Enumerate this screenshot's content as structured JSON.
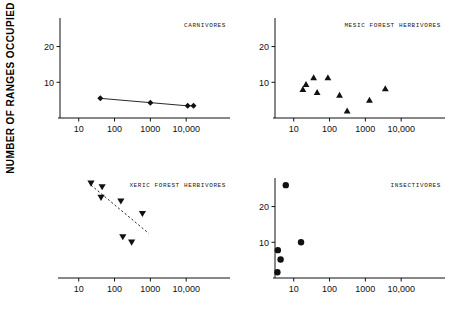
{
  "figure": {
    "y_axis_title": "NUMBER OF RANGES OCCUPIED",
    "x_tick_labels": [
      "10",
      "100",
      "1000",
      "10,000"
    ],
    "y_tick_labels": [
      "10",
      "20"
    ],
    "accent_color": "#111111"
  },
  "chart_data": [
    {
      "type": "scatter",
      "title": "CARNIVORES",
      "panel": "top-left",
      "marker": "diamond",
      "xlabel": "",
      "ylabel": "NUMBER OF RANGES OCCUPIED",
      "xscale": "log",
      "xlim": [
        3,
        100000
      ],
      "ylim": [
        0,
        28
      ],
      "xticks": [
        10,
        100,
        1000,
        10000
      ],
      "xticklabels": [
        "10",
        "100",
        "1000",
        "10,000"
      ],
      "yticks": [
        10,
        20
      ],
      "yticklabels": [
        "10",
        "20"
      ],
      "grid": false,
      "connected": true,
      "points": [
        {
          "x": 40,
          "y": 5.5
        },
        {
          "x": 1000,
          "y": 4.3
        },
        {
          "x": 11000,
          "y": 3.4
        },
        {
          "x": 16000,
          "y": 3.4
        }
      ]
    },
    {
      "type": "scatter",
      "title": "MESIC FOREST HERBIVORES",
      "panel": "top-right",
      "marker": "triangle-up",
      "xlabel": "",
      "ylabel": "",
      "xscale": "log",
      "xlim": [
        3,
        100000
      ],
      "ylim": [
        0,
        28
      ],
      "xticks": [
        10,
        100,
        1000,
        10000
      ],
      "xticklabels": [
        "10",
        "100",
        "1000",
        "10,000"
      ],
      "yticks": [
        10,
        20
      ],
      "yticklabels": [
        "10",
        "20"
      ],
      "grid": false,
      "connected": false,
      "points": [
        {
          "x": 18,
          "y": 8.0
        },
        {
          "x": 22,
          "y": 9.4
        },
        {
          "x": 36,
          "y": 11.3
        },
        {
          "x": 45,
          "y": 7.2
        },
        {
          "x": 90,
          "y": 11.3
        },
        {
          "x": 190,
          "y": 6.4
        },
        {
          "x": 310,
          "y": 2.0
        },
        {
          "x": 1300,
          "y": 5.0
        },
        {
          "x": 3600,
          "y": 8.2
        }
      ]
    },
    {
      "type": "scatter",
      "title": "XERIC FOREST HERBIVORES",
      "panel": "bottom-left",
      "marker": "triangle-down",
      "xlabel": "",
      "ylabel": "",
      "xscale": "log",
      "xlim": [
        3,
        100000
      ],
      "ylim": [
        0,
        28
      ],
      "xticks": [
        10,
        100,
        1000,
        10000
      ],
      "xticklabels": [
        "10",
        "100",
        "1000",
        "10,000"
      ],
      "yticks": [],
      "yticklabels": [],
      "grid": false,
      "connected": false,
      "trendline": {
        "style": "dashed",
        "x0": 22,
        "y0": 26.0,
        "x1": 900,
        "y1": 12.5
      },
      "points": [
        {
          "x": 22,
          "y": 26.5
        },
        {
          "x": 45,
          "y": 25.5
        },
        {
          "x": 42,
          "y": 22.5
        },
        {
          "x": 150,
          "y": 21.5
        },
        {
          "x": 600,
          "y": 18.0
        },
        {
          "x": 170,
          "y": 11.5
        },
        {
          "x": 300,
          "y": 10.0
        }
      ]
    },
    {
      "type": "scatter",
      "title": "INSECTIVORES",
      "panel": "bottom-right",
      "marker": "circle",
      "xlabel": "",
      "ylabel": "",
      "xscale": "log",
      "xlim": [
        3,
        100000
      ],
      "ylim": [
        0,
        28
      ],
      "xticks": [
        10,
        100,
        1000,
        10000
      ],
      "xticklabels": [
        "10",
        "100",
        "1000",
        "10,000"
      ],
      "yticks": [
        10,
        20
      ],
      "yticklabels": [
        "10",
        "20"
      ],
      "grid": false,
      "connected": false,
      "points": [
        {
          "x": 6.0,
          "y": 26.0
        },
        {
          "x": 16.0,
          "y": 10.0
        },
        {
          "x": 3.6,
          "y": 7.8
        },
        {
          "x": 4.3,
          "y": 5.2
        },
        {
          "x": 3.5,
          "y": 1.6
        }
      ]
    }
  ]
}
